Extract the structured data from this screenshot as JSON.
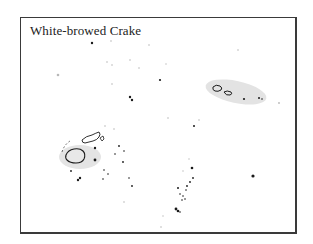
{
  "map": {
    "title": "White-browed Crake",
    "colors": {
      "frame": "#3a3a3a",
      "range_fill": "#e2e2e2",
      "island_outline": "#1a1a1a",
      "dot_dark": "#1a1a1a",
      "dot_light": "#bcbcbc"
    },
    "range_areas": [
      {
        "name": "range-samoa",
        "cx": 242,
        "cy": 92,
        "rx": 31,
        "ry": 11,
        "rotate": 12
      },
      {
        "name": "range-fiji",
        "cx": 82,
        "cy": 155,
        "rx": 22,
        "ry": 13,
        "rotate": 0
      }
    ]
  }
}
